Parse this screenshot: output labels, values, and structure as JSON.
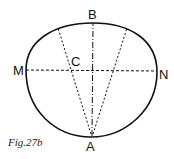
{
  "figure": {
    "caption": "Fig.27b",
    "points": {
      "A": "A",
      "B": "B",
      "C": "C",
      "M": "M",
      "N": "N"
    },
    "colors": {
      "stroke": "#111111",
      "background": "#ffffff"
    }
  }
}
